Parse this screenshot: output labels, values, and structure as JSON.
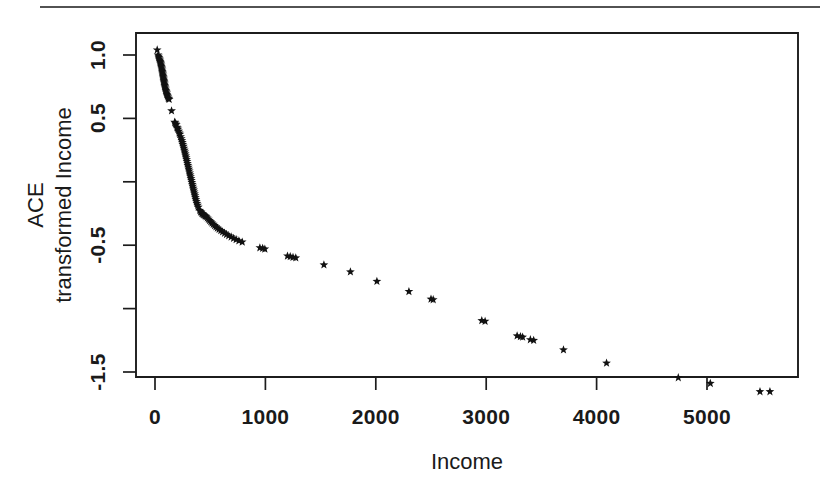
{
  "figure": {
    "background_color": "#ffffff",
    "foreground_color": "#111111",
    "page_rule_present": true
  },
  "axis_titles": {
    "x": "Income",
    "y_line1": "ACE",
    "y_line2": "transformed Income"
  },
  "chart_data": {
    "type": "scatter",
    "title": "",
    "subtitle": "",
    "xlabel": "Income",
    "ylabel": "ACE transformed Income",
    "ylabel_lines": [
      "ACE",
      "transformed Income"
    ],
    "marker": "star",
    "marker_color": "#111111",
    "grid": false,
    "legend": null,
    "legend_position": "none",
    "xlim": [
      -180,
      5820
    ],
    "ylim": [
      -1.78,
      1.12
    ],
    "xticks": [
      0,
      1000,
      2000,
      3000,
      4000,
      5000
    ],
    "xtick_labels": [
      "0",
      "1000",
      "2000",
      "3000",
      "4000",
      "5000"
    ],
    "yticks": [
      1.0,
      0.5,
      0.0,
      -0.5,
      -1.0,
      -1.5
    ],
    "ytick_labels": [
      "1.0",
      "0.5",
      "",
      "-0.5",
      "",
      "-1.5"
    ],
    "ytick_labels_shown": [
      "1.0",
      "0.5",
      "-0.5",
      "-1.5"
    ],
    "series": [
      {
        "name": "ACE transform",
        "points": [
          [
            20,
            1.04
          ],
          [
            28,
            1.0
          ],
          [
            32,
            0.99
          ],
          [
            36,
            0.98
          ],
          [
            40,
            0.97
          ],
          [
            44,
            0.96
          ],
          [
            47,
            0.95
          ],
          [
            50,
            0.94
          ],
          [
            52,
            0.93
          ],
          [
            55,
            0.92
          ],
          [
            57,
            0.91
          ],
          [
            60,
            0.9
          ],
          [
            62,
            0.89
          ],
          [
            64,
            0.88
          ],
          [
            66,
            0.87
          ],
          [
            68,
            0.86
          ],
          [
            70,
            0.85
          ],
          [
            72,
            0.84
          ],
          [
            74,
            0.83
          ],
          [
            76,
            0.82
          ],
          [
            78,
            0.81
          ],
          [
            80,
            0.8
          ],
          [
            82,
            0.79
          ],
          [
            84,
            0.78
          ],
          [
            86,
            0.77
          ],
          [
            88,
            0.76
          ],
          [
            90,
            0.75
          ],
          [
            93,
            0.74
          ],
          [
            96,
            0.73
          ],
          [
            99,
            0.72
          ],
          [
            102,
            0.71
          ],
          [
            105,
            0.7
          ],
          [
            108,
            0.69
          ],
          [
            112,
            0.68
          ],
          [
            116,
            0.67
          ],
          [
            120,
            0.66
          ],
          [
            124,
            0.655
          ],
          [
            128,
            0.65
          ],
          [
            150,
            0.56
          ],
          [
            178,
            0.47
          ],
          [
            182,
            0.465
          ],
          [
            188,
            0.455
          ],
          [
            193,
            0.45
          ],
          [
            198,
            0.43
          ],
          [
            203,
            0.425
          ],
          [
            208,
            0.415
          ],
          [
            215,
            0.4
          ],
          [
            220,
            0.385
          ],
          [
            226,
            0.375
          ],
          [
            232,
            0.355
          ],
          [
            238,
            0.34
          ],
          [
            243,
            0.325
          ],
          [
            248,
            0.31
          ],
          [
            252,
            0.295
          ],
          [
            257,
            0.28
          ],
          [
            262,
            0.265
          ],
          [
            266,
            0.25
          ],
          [
            270,
            0.235
          ],
          [
            274,
            0.22
          ],
          [
            278,
            0.205
          ],
          [
            282,
            0.19
          ],
          [
            286,
            0.175
          ],
          [
            290,
            0.16
          ],
          [
            294,
            0.145
          ],
          [
            298,
            0.13
          ],
          [
            302,
            0.115
          ],
          [
            306,
            0.1
          ],
          [
            310,
            0.085
          ],
          [
            314,
            0.07
          ],
          [
            318,
            0.055
          ],
          [
            322,
            0.04
          ],
          [
            326,
            0.025
          ],
          [
            330,
            0.01
          ],
          [
            334,
            -0.005
          ],
          [
            338,
            -0.02
          ],
          [
            342,
            -0.035
          ],
          [
            346,
            -0.05
          ],
          [
            350,
            -0.065
          ],
          [
            354,
            -0.08
          ],
          [
            358,
            -0.095
          ],
          [
            362,
            -0.11
          ],
          [
            366,
            -0.125
          ],
          [
            370,
            -0.14
          ],
          [
            375,
            -0.155
          ],
          [
            380,
            -0.17
          ],
          [
            386,
            -0.185
          ],
          [
            392,
            -0.2
          ],
          [
            405,
            -0.225
          ],
          [
            412,
            -0.235
          ],
          [
            418,
            -0.24
          ],
          [
            425,
            -0.25
          ],
          [
            432,
            -0.255
          ],
          [
            440,
            -0.26
          ],
          [
            448,
            -0.265
          ],
          [
            456,
            -0.27
          ],
          [
            464,
            -0.275
          ],
          [
            474,
            -0.285
          ],
          [
            484,
            -0.295
          ],
          [
            494,
            -0.305
          ],
          [
            505,
            -0.315
          ],
          [
            516,
            -0.325
          ],
          [
            528,
            -0.335
          ],
          [
            540,
            -0.345
          ],
          [
            552,
            -0.355
          ],
          [
            565,
            -0.365
          ],
          [
            580,
            -0.375
          ],
          [
            596,
            -0.385
          ],
          [
            612,
            -0.395
          ],
          [
            630,
            -0.405
          ],
          [
            648,
            -0.415
          ],
          [
            668,
            -0.425
          ],
          [
            690,
            -0.435
          ],
          [
            712,
            -0.445
          ],
          [
            735,
            -0.455
          ],
          [
            760,
            -0.465
          ],
          [
            790,
            -0.475
          ],
          [
            950,
            -0.52
          ],
          [
            975,
            -0.525
          ],
          [
            995,
            -0.53
          ],
          [
            1200,
            -0.585
          ],
          [
            1225,
            -0.59
          ],
          [
            1250,
            -0.595
          ],
          [
            1275,
            -0.6
          ],
          [
            1530,
            -0.655
          ],
          [
            1770,
            -0.71
          ],
          [
            2010,
            -0.785
          ],
          [
            2300,
            -0.865
          ],
          [
            2500,
            -0.925
          ],
          [
            2520,
            -0.93
          ],
          [
            2960,
            -1.095
          ],
          [
            2990,
            -1.1
          ],
          [
            3280,
            -1.215
          ],
          [
            3310,
            -1.22
          ],
          [
            3330,
            -1.225
          ],
          [
            3400,
            -1.245
          ],
          [
            3430,
            -1.25
          ],
          [
            3700,
            -1.325
          ],
          [
            4090,
            -1.43
          ],
          [
            4740,
            -1.545
          ],
          [
            5030,
            -1.59
          ],
          [
            5480,
            -1.655
          ],
          [
            5570,
            -1.655
          ]
        ]
      }
    ]
  },
  "plot_geometry": {
    "box_left": 136,
    "box_top": 33,
    "box_right": 798,
    "box_bottom": 377,
    "x_pixel_at_0": 155,
    "x_pixels_per_1000": 110.4,
    "y_pixel_at_1_0": 55,
    "y_pixels_per_0_5": 63.4
  }
}
